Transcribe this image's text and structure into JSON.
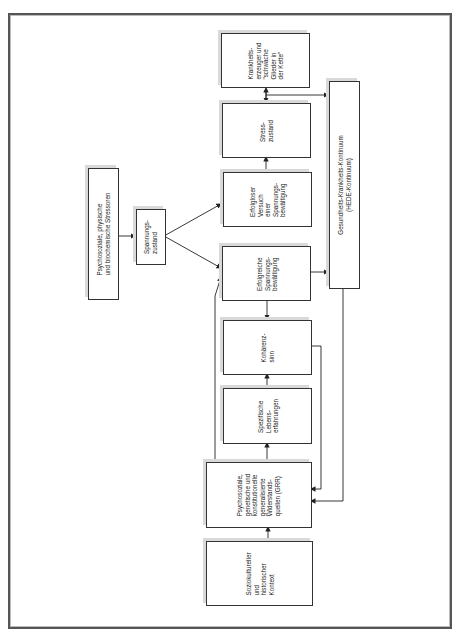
{
  "diagram": {
    "orientation": "rotated-90-ccw",
    "nodes": {
      "stressoren": {
        "label": "Psychosoziale, physische\nund biochemische Stressoren"
      },
      "spannungszustand": {
        "label": "Spannungs-\nzustand"
      },
      "erfolgloser": {
        "label": "Erfolgloser\nVersuch\neiner\nSpannungs-\nbewältigung"
      },
      "erfolgreiche": {
        "label": "Erfolgreiche\nSpannungs-\nbewältigung"
      },
      "stresszustand": {
        "label": "Stress-\nzustand"
      },
      "krankheitserzeuger": {
        "label": "Krankheits-\nerzeuger und\n\"schwache\nGlieder in\nder Kette\""
      },
      "hede": {
        "label": "Gesundheits-Krankheits-Kontinuum\n(HEDE-Kontinuum)"
      },
      "kohaerenzsinn": {
        "label": "Kohärenz-\nsinn"
      },
      "lebenserfahrungen": {
        "label": "Spezifische\nLebens-\nerfahrungen"
      },
      "grr": {
        "label": "Psychosoziale,\ngenetische und\nkonstitutionelle\ngeneralisierte\nWiderstands-\nquellen (GRR)"
      },
      "kontext": {
        "label": "Soziokultureller\nund\nhistorischer\nKontext"
      }
    },
    "edges": [
      {
        "from": "stressoren",
        "to": "spannungszustand"
      },
      {
        "from": "spannungszustand",
        "to": "erfolgloser"
      },
      {
        "from": "spannungszustand",
        "to": "erfolgreiche"
      },
      {
        "from": "erfolgloser",
        "to": "stresszustand"
      },
      {
        "from": "stresszustand",
        "to": "krankheitserzeuger",
        "bidirectional": true
      },
      {
        "from": "krankheitserzeuger",
        "to": "hede"
      },
      {
        "from": "erfolgreiche",
        "to": "hede"
      },
      {
        "from": "erfolgreiche",
        "to": "kohaerenzsinn"
      },
      {
        "from": "lebenserfahrungen",
        "to": "kohaerenzsinn"
      },
      {
        "from": "grr",
        "to": "lebenserfahrungen"
      },
      {
        "from": "kontext",
        "to": "grr"
      },
      {
        "from": "grr",
        "to": "erfolgreiche"
      },
      {
        "from": "kohaerenzsinn",
        "to": "grr"
      },
      {
        "from": "hede",
        "to": "grr"
      }
    ],
    "colors": {
      "line": "#222222",
      "border": "#333333",
      "shadow": "#d9d9d9"
    }
  }
}
